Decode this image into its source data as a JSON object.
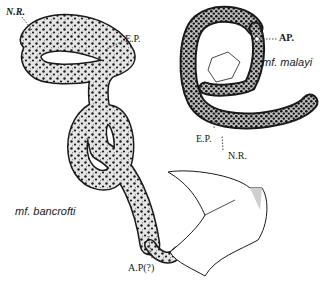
{
  "figure": {
    "specimens": [
      {
        "name": "mf. bancrofti",
        "labels": {
          "nerve_ring": "N.R.",
          "excretory_pore": "E.P.",
          "anal_pore": "A.P(?)"
        }
      },
      {
        "name": "mf. malayi",
        "labels": {
          "anal_pore": "AP.",
          "excretory_pore": "E.P.",
          "nerve_ring": "N.R."
        }
      }
    ],
    "colors": {
      "ink": "#1a1a1a",
      "body_stipple": "#d9d9d9",
      "background": "#ffffff"
    }
  }
}
